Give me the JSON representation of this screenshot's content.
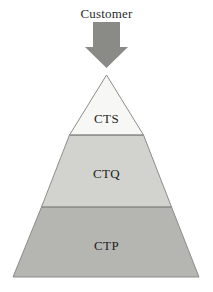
{
  "diagram": {
    "title_label": "Customer",
    "arrow": {
      "icon": "down-arrow-icon",
      "color": "#8a8a87",
      "direction": "down"
    },
    "background_color": "#ffffff",
    "outline_color": "#8c8c89",
    "tiers": [
      {
        "id": "cts",
        "label": "CTS",
        "color": "#f7f7f5",
        "level": 1,
        "position": "top"
      },
      {
        "id": "ctq",
        "label": "CTQ",
        "color": "#d2d2cf",
        "level": 2,
        "position": "middle"
      },
      {
        "id": "ctp",
        "label": "CTP",
        "color": "#b5b5b2",
        "level": 3,
        "position": "bottom"
      }
    ]
  }
}
